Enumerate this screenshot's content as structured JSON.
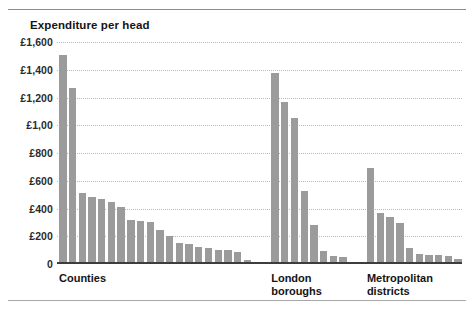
{
  "chart_data": {
    "type": "bar",
    "title": "Expenditure per head",
    "xlabel": "",
    "ylabel": "",
    "ylim": [
      0,
      1600
    ],
    "grid": true,
    "legend": false,
    "ytick_labels": [
      "£1,600",
      "£1,400",
      "£1,200",
      "£1,00",
      "£800",
      "£600",
      "£400",
      "£200",
      "0"
    ],
    "ytick_values": [
      1600,
      1400,
      1200,
      1000,
      800,
      600,
      400,
      200,
      0
    ],
    "bar_color": "#9b9b9b",
    "axis_color": "#3d3d3d",
    "gridline_color": "#b9b9b9",
    "groups": [
      {
        "name": "Counties",
        "label": "Counties",
        "values": [
          1490,
          1255,
          500,
          470,
          455,
          430,
          398,
          305,
          295,
          285,
          228,
          185,
          140,
          130,
          107,
          100,
          88,
          85,
          75,
          12
        ]
      },
      {
        "name": "London boroughs",
        "label": "London\nboroughs",
        "values": [
          1360,
          1150,
          1035,
          510,
          265,
          80,
          42,
          35
        ]
      },
      {
        "name": "Metropolitan districts",
        "label": "Metropolitan\ndistricts",
        "values": [
          680,
          350,
          325,
          283,
          100,
          58,
          50,
          48,
          45,
          25
        ]
      }
    ]
  }
}
